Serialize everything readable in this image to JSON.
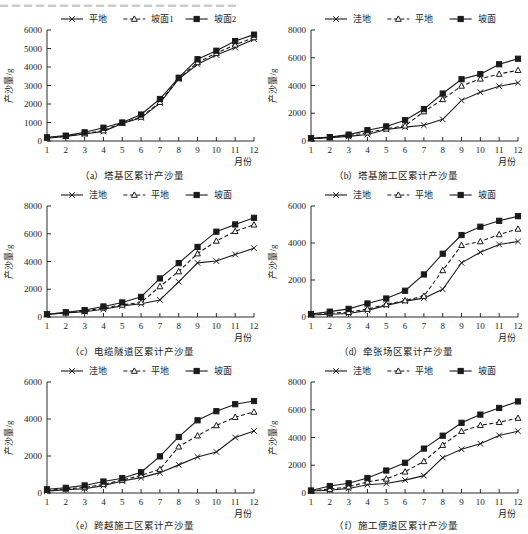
{
  "top_strip_text": "▬ ▬ ▬ ▬ ▬ ▬ ▬ ▬ ▬ ▬ ▬ ▬ ▬ ▬ ▬ ▬ ▬ ▬ ▬ ▬",
  "axis": {
    "x_title": "月份",
    "y_title": "产沙量/g"
  },
  "series_styles": {
    "flat_a": {
      "marker": "cross",
      "dash": false
    },
    "slope1_a": {
      "marker": "triangle",
      "dash": true
    },
    "slope2_a": {
      "marker": "square",
      "dash": false
    },
    "lowland": {
      "marker": "cross",
      "dash": false
    },
    "flat": {
      "marker": "triangle",
      "dash": true
    },
    "slope": {
      "marker": "square",
      "dash": false
    }
  },
  "chart_data": [
    {
      "id": "a",
      "type": "line",
      "title": "（a）塔基区累计产沙量",
      "xlabel": "月份",
      "ylabel": "产沙量/g",
      "categories": [
        1,
        2,
        3,
        4,
        5,
        6,
        7,
        8,
        9,
        10,
        11,
        12
      ],
      "xlim": [
        1,
        12
      ],
      "ylim": [
        0,
        6000
      ],
      "yticks": [
        0,
        1000,
        2000,
        3000,
        4000,
        5000,
        6000
      ],
      "legend_position": "top",
      "grid": false,
      "series": [
        {
          "name": "平地",
          "style": "flat_a",
          "values": [
            150,
            250,
            380,
            520,
            950,
            1250,
            2050,
            3350,
            4150,
            4650,
            5050,
            5500
          ]
        },
        {
          "name": "坡面1",
          "style": "slope1_a",
          "values": [
            170,
            260,
            400,
            560,
            980,
            1300,
            2100,
            3380,
            4250,
            4750,
            5200,
            5600
          ]
        },
        {
          "name": "坡面2",
          "style": "slope2_a",
          "values": [
            200,
            290,
            470,
            720,
            1000,
            1430,
            2270,
            3420,
            4420,
            4880,
            5400,
            5750
          ]
        }
      ]
    },
    {
      "id": "b",
      "type": "line",
      "title": "（b）塔基施工区累计产沙量",
      "xlabel": "月份",
      "ylabel": "产沙量/g",
      "categories": [
        1,
        2,
        3,
        4,
        5,
        6,
        7,
        8,
        9,
        10,
        11,
        12
      ],
      "xlim": [
        1,
        12
      ],
      "ylim": [
        0,
        8000
      ],
      "yticks": [
        0,
        2000,
        4000,
        6000,
        8000
      ],
      "legend_position": "top",
      "grid": false,
      "series": [
        {
          "name": "洼地",
          "style": "lowland",
          "values": [
            170,
            240,
            330,
            470,
            830,
            1000,
            1130,
            1560,
            2930,
            3520,
            3950,
            4200
          ]
        },
        {
          "name": "平地",
          "style": "flat",
          "values": [
            180,
            260,
            400,
            600,
            880,
            1100,
            2120,
            3000,
            3970,
            4480,
            4830,
            5100
          ]
        },
        {
          "name": "坡面",
          "style": "slope",
          "values": [
            200,
            280,
            460,
            780,
            1050,
            1500,
            2300,
            3420,
            4450,
            4820,
            5530,
            5930
          ]
        }
      ]
    },
    {
      "id": "c",
      "type": "line",
      "title": "（c）电缆隧道区累计产沙量",
      "xlabel": "月份",
      "ylabel": "产沙量/g",
      "categories": [
        1,
        2,
        3,
        4,
        5,
        6,
        7,
        8,
        9,
        10,
        11,
        12
      ],
      "xlim": [
        1,
        12
      ],
      "ylim": [
        0,
        8000
      ],
      "yticks": [
        0,
        2000,
        4000,
        6000,
        8000
      ],
      "legend_position": "top",
      "grid": false,
      "series": [
        {
          "name": "洼地",
          "style": "lowland",
          "values": [
            180,
            300,
            380,
            560,
            800,
            950,
            1230,
            2530,
            3900,
            4030,
            4510,
            4960
          ]
        },
        {
          "name": "平地",
          "style": "flat",
          "values": [
            190,
            320,
            420,
            660,
            870,
            1050,
            2200,
            3280,
            4570,
            5480,
            6180,
            6650
          ]
        },
        {
          "name": "坡面",
          "style": "slope",
          "values": [
            200,
            340,
            500,
            760,
            1050,
            1450,
            2780,
            3880,
            5050,
            6150,
            6670,
            7150
          ]
        }
      ]
    },
    {
      "id": "d",
      "type": "line",
      "title": "（d）牵张场区累计产沙量",
      "xlabel": "月份",
      "ylabel": "产沙量/g",
      "categories": [
        1,
        2,
        3,
        4,
        5,
        6,
        7,
        8,
        9,
        10,
        11,
        12
      ],
      "xlim": [
        1,
        12
      ],
      "ylim": [
        0,
        6000
      ],
      "yticks": [
        0,
        2000,
        4000,
        6000
      ],
      "legend_position": "top",
      "grid": false,
      "series": [
        {
          "name": "洼地",
          "style": "lowland",
          "values": [
            110,
            150,
            190,
            360,
            630,
            860,
            1020,
            1500,
            2930,
            3500,
            3920,
            4080
          ]
        },
        {
          "name": "平地",
          "style": "flat",
          "values": [
            130,
            200,
            260,
            430,
            680,
            890,
            1130,
            2520,
            3880,
            4080,
            4460,
            4760
          ]
        },
        {
          "name": "坡面",
          "style": "slope",
          "values": [
            160,
            290,
            440,
            730,
            1000,
            1420,
            2300,
            3420,
            4430,
            4880,
            5200,
            5450
          ]
        }
      ]
    },
    {
      "id": "e",
      "type": "line",
      "title": "（e）跨越施工区累计产沙量",
      "xlabel": "月份",
      "ylabel": "产沙量/g",
      "categories": [
        1,
        2,
        3,
        4,
        5,
        6,
        7,
        8,
        9,
        10,
        11,
        12
      ],
      "xlim": [
        1,
        12
      ],
      "ylim": [
        0,
        6000
      ],
      "yticks": [
        0,
        2000,
        4000,
        6000
      ],
      "legend_position": "top",
      "grid": false,
      "series": [
        {
          "name": "洼地",
          "style": "lowland",
          "values": [
            100,
            180,
            230,
            400,
            650,
            830,
            1100,
            1520,
            1950,
            2220,
            3000,
            3350
          ]
        },
        {
          "name": "平地",
          "style": "flat",
          "values": [
            150,
            220,
            300,
            470,
            700,
            950,
            1280,
            2500,
            3100,
            3650,
            4100,
            4380
          ]
        },
        {
          "name": "坡面",
          "style": "slope",
          "values": [
            200,
            280,
            410,
            620,
            800,
            1120,
            1980,
            3030,
            3930,
            4420,
            4800,
            4970
          ]
        }
      ]
    },
    {
      "id": "f",
      "type": "line",
      "title": "（f）施工便道区累计产沙量",
      "xlabel": "月份",
      "ylabel": "产沙量/g",
      "categories": [
        1,
        2,
        3,
        4,
        5,
        6,
        7,
        8,
        9,
        10,
        11,
        12
      ],
      "xlim": [
        1,
        12
      ],
      "ylim": [
        0,
        8000
      ],
      "yticks": [
        0,
        2000,
        4000,
        6000,
        8000
      ],
      "legend_position": "top",
      "grid": false,
      "series": [
        {
          "name": "洼地",
          "style": "lowland",
          "values": [
            140,
            200,
            330,
            600,
            680,
            930,
            1250,
            2550,
            3150,
            3550,
            4150,
            4450
          ]
        },
        {
          "name": "平地",
          "style": "flat",
          "values": [
            160,
            280,
            450,
            800,
            1020,
            1530,
            2280,
            3450,
            4450,
            4880,
            5100,
            5400
          ]
        },
        {
          "name": "坡面",
          "style": "slope",
          "values": [
            180,
            500,
            700,
            1080,
            1620,
            2180,
            3200,
            4130,
            5060,
            5650,
            6130,
            6600
          ]
        }
      ]
    }
  ]
}
